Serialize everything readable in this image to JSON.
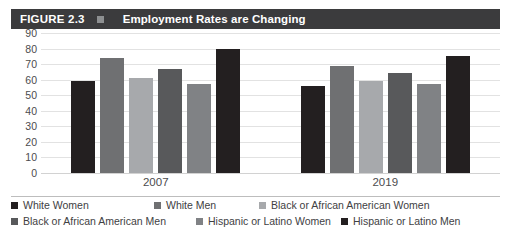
{
  "header": {
    "figure_number": "FIGURE 2.3",
    "separator_icon": "square-icon",
    "title": "Employment Rates are Changing",
    "bar_color": "#3b3b3d"
  },
  "chart_data": {
    "type": "bar",
    "title": "Employment Rates are Changing",
    "xlabel": "",
    "ylabel": "",
    "ylim": [
      0,
      90
    ],
    "yticks": [
      90,
      80,
      70,
      60,
      50,
      40,
      30,
      20,
      10,
      0
    ],
    "grid": true,
    "legend_position": "bottom",
    "categories": [
      "2007",
      "2019"
    ],
    "series": [
      {
        "name": "White Women",
        "color": "#231f20",
        "values": [
          59,
          56
        ]
      },
      {
        "name": "White Men",
        "color": "#6f7072",
        "values": [
          74,
          69
        ]
      },
      {
        "name": "Black or African American Women",
        "color": "#a7a9ac",
        "values": [
          61,
          59
        ]
      },
      {
        "name": "Black or African American Men",
        "color": "#58595b",
        "values": [
          67,
          64
        ]
      },
      {
        "name": "Hispanic or Latino Women",
        "color": "#808285",
        "values": [
          57,
          57
        ]
      },
      {
        "name": "Hispanic or Latino Men",
        "color": "#231f20",
        "values": [
          80,
          75
        ]
      }
    ]
  }
}
